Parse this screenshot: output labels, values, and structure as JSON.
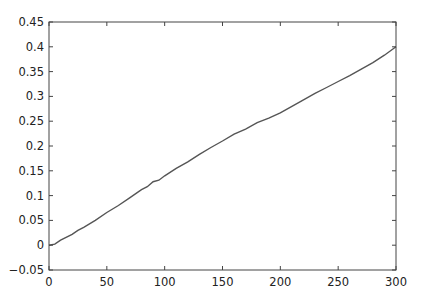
{
  "chart_data": {
    "type": "line",
    "title": "",
    "xlabel": "",
    "ylabel": "",
    "xlim": [
      0,
      300
    ],
    "ylim": [
      -0.05,
      0.45
    ],
    "grid": false,
    "legend": null,
    "x_ticks": [
      0,
      50,
      100,
      150,
      200,
      250,
      300
    ],
    "x_tick_labels": [
      "0",
      "50",
      "100",
      "150",
      "200",
      "250",
      "300"
    ],
    "y_ticks": [
      -0.05,
      0,
      0.05,
      0.1,
      0.15,
      0.2,
      0.25,
      0.3,
      0.35,
      0.4,
      0.45
    ],
    "y_tick_labels": [
      "−0.05",
      "0",
      "0.05",
      "0.1",
      "0.15",
      "0.2",
      "0.25",
      "0.3",
      "0.35",
      "0.4",
      "0.45"
    ],
    "series": [
      {
        "name": "series-1",
        "color": "#555555",
        "x": [
          0,
          5,
          10,
          20,
          25,
          30,
          40,
          50,
          60,
          70,
          80,
          85,
          90,
          95,
          100,
          110,
          120,
          130,
          140,
          150,
          160,
          170,
          180,
          190,
          200,
          210,
          220,
          230,
          240,
          250,
          260,
          270,
          280,
          290,
          300
        ],
        "y": [
          0.0,
          0.002,
          0.01,
          0.022,
          0.03,
          0.036,
          0.05,
          0.066,
          0.08,
          0.096,
          0.112,
          0.118,
          0.128,
          0.131,
          0.14,
          0.155,
          0.168,
          0.183,
          0.197,
          0.21,
          0.224,
          0.234,
          0.247,
          0.256,
          0.267,
          0.28,
          0.293,
          0.306,
          0.318,
          0.33,
          0.342,
          0.355,
          0.368,
          0.383,
          0.4
        ]
      }
    ]
  }
}
